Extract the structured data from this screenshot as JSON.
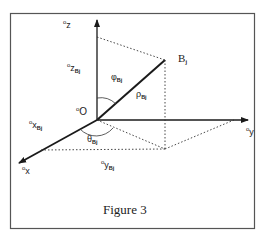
{
  "figure": {
    "caption": "Figure 3",
    "frame_color": "#555555",
    "line_color": "#1a1a1a"
  },
  "labels": {
    "z_axis": {
      "prefix": "o",
      "main": "z"
    },
    "zbj": {
      "prefix": "o",
      "main": "z",
      "sub": "Bj"
    },
    "origin": {
      "prefix": "o",
      "main": "O"
    },
    "xbj": {
      "prefix": "o",
      "main": "x",
      "sub": "Bj"
    },
    "x_axis": {
      "prefix": "o",
      "main": "x"
    },
    "ybj": {
      "prefix": "o",
      "main": "y",
      "sub": "Bj"
    },
    "y_axis": {
      "prefix": "o",
      "main": "y"
    },
    "point_b": {
      "main": "B",
      "sub": "j"
    },
    "phi": {
      "main": "φ",
      "sub": "Bj"
    },
    "rho": {
      "main": "ρ",
      "sub": "Bj"
    },
    "theta": {
      "main": "θ",
      "sub": "Bj"
    }
  }
}
